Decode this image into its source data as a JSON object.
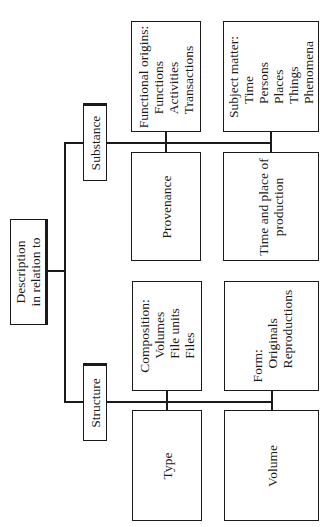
{
  "root": {
    "lines": [
      "Description",
      "in relation to"
    ]
  },
  "categories": {
    "substance": {
      "label": "Substance"
    },
    "structure": {
      "label": "Structure"
    }
  },
  "boxes": {
    "functional_origins": {
      "heading": "Functional origins:",
      "items": [
        "Functions",
        "Activities",
        "Transactions"
      ]
    },
    "subject_matter": {
      "heading": "Subject matter:",
      "items": [
        "Time",
        "Persons",
        "Places",
        "Things",
        "Phenomena"
      ]
    },
    "provenance": {
      "lines": [
        "Provenance"
      ]
    },
    "time_place": {
      "lines": [
        "Time and place of",
        "production"
      ]
    },
    "composition": {
      "heading": "Composition:",
      "items": [
        "Volumes",
        "File units",
        "Files"
      ]
    },
    "form": {
      "heading": "Form:",
      "items": [
        "Originals",
        "Reproductions"
      ]
    },
    "type": {
      "lines": [
        "Type"
      ]
    },
    "volume": {
      "lines": [
        "Volume"
      ]
    }
  }
}
